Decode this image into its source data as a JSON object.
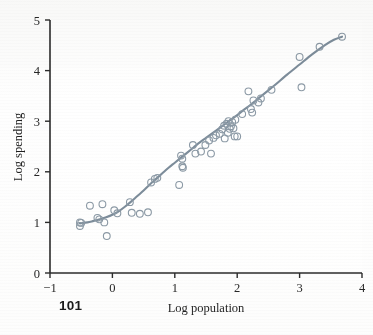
{
  "page": {
    "page_number": "101",
    "background_color": "#fefefe"
  },
  "chart_data": {
    "type": "scatter",
    "title": "",
    "subtitle": "",
    "xlabel": "Log population",
    "ylabel": "Log spending",
    "xlim": [
      -1,
      4
    ],
    "ylim": [
      0,
      5
    ],
    "xticks": [
      -1,
      0,
      1,
      2,
      3,
      4
    ],
    "xtick_labels": [
      "−1",
      "0",
      "1",
      "2",
      "3",
      "4"
    ],
    "yticks": [
      0,
      1,
      2,
      3,
      4,
      5
    ],
    "ytick_labels": [
      "0",
      "1",
      "2",
      "3",
      "4",
      "5"
    ],
    "grid": false,
    "legend": null,
    "legend_position": "none",
    "marker": {
      "style": "open-circle",
      "edge_color": "#8c9aa6",
      "fill_color": "none",
      "radius": 3.4,
      "stroke_width": 1.1
    },
    "fit_line": {
      "name": "smoothed fit (loess)",
      "color": "#7d8d9b",
      "width": 2.1,
      "style": "solid",
      "points": [
        [
          -0.52,
          0.98
        ],
        [
          -0.4,
          1.0
        ],
        [
          -0.3,
          1.03
        ],
        [
          -0.2,
          1.06
        ],
        [
          -0.1,
          1.1
        ],
        [
          0.0,
          1.15
        ],
        [
          0.1,
          1.22
        ],
        [
          0.2,
          1.31
        ],
        [
          0.3,
          1.41
        ],
        [
          0.4,
          1.52
        ],
        [
          0.5,
          1.63
        ],
        [
          0.6,
          1.75
        ],
        [
          0.7,
          1.86
        ],
        [
          0.8,
          1.97
        ],
        [
          0.9,
          2.08
        ],
        [
          1.0,
          2.18
        ],
        [
          1.1,
          2.28
        ],
        [
          1.2,
          2.38
        ],
        [
          1.3,
          2.48
        ],
        [
          1.4,
          2.58
        ],
        [
          1.5,
          2.67
        ],
        [
          1.6,
          2.76
        ],
        [
          1.7,
          2.85
        ],
        [
          1.8,
          2.94
        ],
        [
          1.9,
          3.03
        ],
        [
          2.0,
          3.12
        ],
        [
          2.1,
          3.22
        ],
        [
          2.2,
          3.31
        ],
        [
          2.3,
          3.41
        ],
        [
          2.4,
          3.51
        ],
        [
          2.5,
          3.61
        ],
        [
          2.6,
          3.71
        ],
        [
          2.8,
          3.92
        ],
        [
          3.0,
          4.12
        ],
        [
          3.2,
          4.32
        ],
        [
          3.4,
          4.5
        ],
        [
          3.55,
          4.61
        ],
        [
          3.68,
          4.67
        ]
      ]
    },
    "series": [
      {
        "name": "cities",
        "x": [
          -0.52,
          -0.52,
          -0.5,
          -0.36,
          -0.24,
          -0.21,
          -0.16,
          -0.13,
          -0.09,
          0.03,
          0.08,
          0.28,
          0.31,
          0.44,
          0.57,
          0.62,
          0.68,
          0.72,
          1.07,
          1.1,
          1.12,
          1.12,
          1.13,
          1.29,
          1.33,
          1.42,
          1.49,
          1.55,
          1.58,
          1.62,
          1.66,
          1.72,
          1.76,
          1.79,
          1.8,
          1.83,
          1.85,
          1.86,
          1.88,
          1.9,
          1.92,
          1.94,
          1.96,
          1.97,
          2.0,
          2.08,
          2.18,
          2.22,
          2.24,
          2.26,
          2.34,
          2.38,
          2.55,
          3.0,
          3.03,
          3.32,
          3.68
        ],
        "y": [
          1.0,
          0.93,
          0.99,
          1.33,
          1.09,
          1.06,
          1.36,
          1.0,
          0.73,
          1.24,
          1.18,
          1.4,
          1.19,
          1.17,
          1.2,
          1.79,
          1.86,
          1.88,
          1.74,
          2.32,
          2.26,
          2.11,
          2.08,
          2.53,
          2.36,
          2.4,
          2.53,
          2.62,
          2.36,
          2.67,
          2.72,
          2.75,
          2.84,
          2.91,
          2.66,
          2.95,
          2.77,
          3.0,
          2.85,
          2.9,
          2.98,
          2.86,
          2.7,
          3.03,
          2.7,
          3.14,
          3.59,
          3.24,
          3.17,
          3.41,
          3.37,
          3.45,
          3.62,
          4.27,
          3.67,
          4.47,
          4.67
        ]
      }
    ]
  },
  "axes": {
    "x_axis_name": "x-axis",
    "y_axis_name": "y-axis",
    "axis_color": "#2b2b2b"
  }
}
